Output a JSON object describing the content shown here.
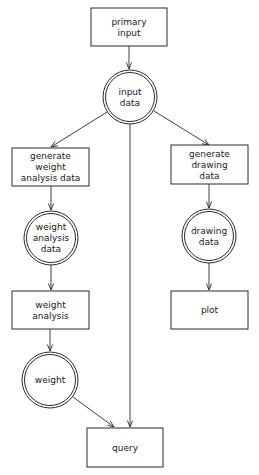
{
  "diagram": {
    "nodes": [
      {
        "id": "primary-input",
        "shape": "box",
        "lines": [
          "primary",
          "input"
        ]
      },
      {
        "id": "input-data",
        "shape": "double-circle",
        "lines": [
          "input",
          "data"
        ]
      },
      {
        "id": "generate-weight-analysis-data",
        "shape": "box",
        "lines": [
          "generate",
          "weight",
          "analysis data"
        ]
      },
      {
        "id": "generate-drawing-data",
        "shape": "box",
        "lines": [
          "generate",
          "drawing",
          "data"
        ]
      },
      {
        "id": "weight-analysis-data",
        "shape": "double-circle",
        "lines": [
          "weight",
          "analysis",
          "data"
        ]
      },
      {
        "id": "drawing-data",
        "shape": "double-circle",
        "lines": [
          "drawing",
          "data"
        ]
      },
      {
        "id": "weight-analysis",
        "shape": "box",
        "lines": [
          "weight",
          "analysis"
        ]
      },
      {
        "id": "plot",
        "shape": "box",
        "lines": [
          "plot"
        ]
      },
      {
        "id": "weight",
        "shape": "double-circle",
        "lines": [
          "weight"
        ]
      },
      {
        "id": "query",
        "shape": "box",
        "lines": [
          "query"
        ]
      }
    ],
    "edges": [
      {
        "from": "primary-input",
        "to": "input-data"
      },
      {
        "from": "input-data",
        "to": "generate-weight-analysis-data"
      },
      {
        "from": "input-data",
        "to": "generate-drawing-data"
      },
      {
        "from": "input-data",
        "to": "query"
      },
      {
        "from": "generate-weight-analysis-data",
        "to": "weight-analysis-data"
      },
      {
        "from": "weight-analysis-data",
        "to": "weight-analysis"
      },
      {
        "from": "weight-analysis",
        "to": "weight"
      },
      {
        "from": "weight",
        "to": "query"
      },
      {
        "from": "generate-drawing-data",
        "to": "drawing-data"
      },
      {
        "from": "drawing-data",
        "to": "plot"
      }
    ]
  }
}
